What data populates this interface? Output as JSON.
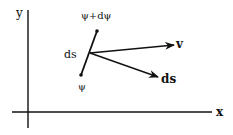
{
  "diagram": {
    "axes": {
      "x_label": "x",
      "y_label": "y"
    },
    "segment": {
      "top_label": "ψ+dψ",
      "bottom_label": "ψ",
      "side_label": "ds"
    },
    "vectors": [
      {
        "name": "velocity",
        "label": "v"
      },
      {
        "name": "ds-vector",
        "label": "ds"
      }
    ],
    "colors": {
      "ink": "#111111",
      "background": "#ffffff"
    }
  }
}
